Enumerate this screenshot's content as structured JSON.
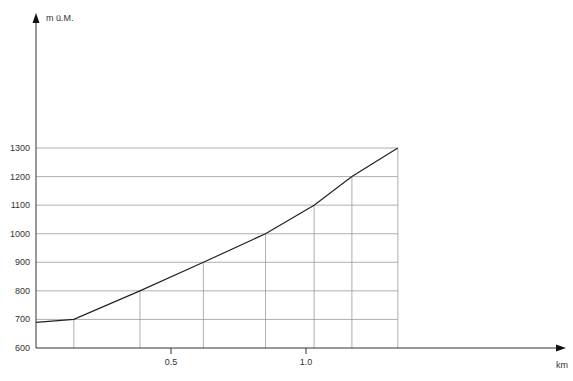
{
  "chart_data": {
    "type": "line",
    "title": "",
    "xlabel": "km",
    "ylabel": "m ü.M.",
    "x_ticks": [
      0.5,
      1.0
    ],
    "x_tick_labels": [
      "0.5",
      "1.0"
    ],
    "y_ticks": [
      600,
      700,
      800,
      900,
      1000,
      1100,
      1200,
      1300
    ],
    "y_tick_labels": [
      "600",
      "700",
      "800",
      "900",
      "1000",
      "1100",
      "1200",
      "1300"
    ],
    "xlim": [
      0,
      1.98
    ],
    "ylim": [
      600,
      1300
    ],
    "grid": "horizontal lines at each 100 m up to profile end; vertical drop lines at each profile point",
    "series": [
      {
        "name": "Höhenprofil",
        "x": [
          0.0,
          0.14,
          0.385,
          0.62,
          0.85,
          1.03,
          1.17,
          1.34
        ],
        "y": [
          690,
          700,
          800,
          900,
          1000,
          1100,
          1200,
          1300
        ]
      }
    ],
    "legend": null
  },
  "axes": {
    "y_label": "m ü.M.",
    "x_label": "km"
  },
  "colors": {
    "line": "#222222",
    "grid": "#9a9a9a",
    "axis": "#333333",
    "text": "#333333"
  }
}
